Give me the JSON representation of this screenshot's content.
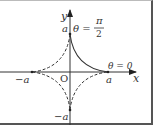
{
  "diagram": {
    "axes": {
      "x_label": "x",
      "y_label": "y",
      "origin_label": "O"
    },
    "tick_labels": {
      "pos_x": "a",
      "neg_x": "−a",
      "pos_y": "a",
      "neg_y": "−a"
    },
    "annotations": {
      "theta_top_lhs": "θ =",
      "theta_top_num": "π",
      "theta_top_den": "2",
      "theta_right": "θ = 0"
    },
    "curve": {
      "solid_segment": "first quadrant",
      "dashed_segments": [
        "second quadrant",
        "third quadrant",
        "fourth quadrant"
      ],
      "color": "#333333"
    }
  }
}
